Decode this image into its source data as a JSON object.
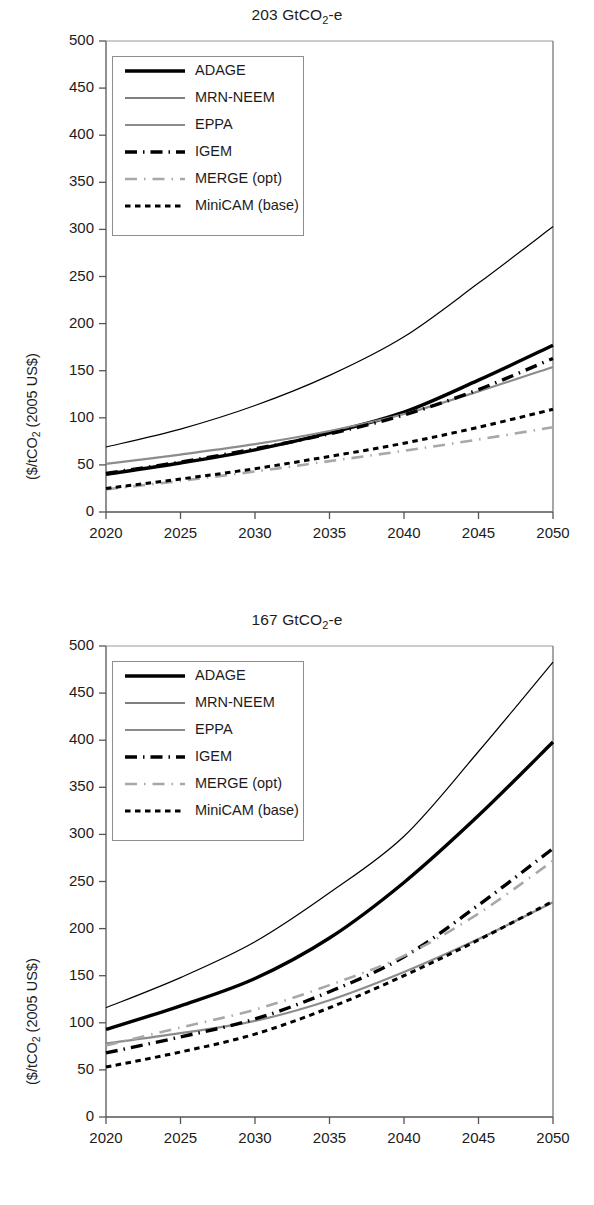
{
  "figure": {
    "ylabel": "($/tCO2 (2005 US$)",
    "ylabel_main": "($/tCO",
    "ylabel_sub": "2",
    "ylabel_tail": " (2005 US$)"
  },
  "legend": {
    "items": [
      {
        "label": "ADAGE",
        "style": "thick-solid",
        "color": "#000000"
      },
      {
        "label": "MRN-NEEM",
        "style": "thin-solid",
        "color": "#000000"
      },
      {
        "label": "EPPA",
        "style": "gray-solid",
        "color": "#8c8c8c"
      },
      {
        "label": "IGEM",
        "style": "dash-dot",
        "color": "#000000"
      },
      {
        "label": "MERGE (opt)",
        "style": "gray-dash-dot",
        "color": "#a8a8a8"
      },
      {
        "label": "MiniCAM (base)",
        "style": "dotted",
        "color": "#000000"
      }
    ]
  },
  "chart_data": [
    {
      "type": "line",
      "title": "203 GtCO2-e",
      "title_main": "203 GtCO",
      "title_sub": "2",
      "title_tail": "-e",
      "xlabel": "",
      "ylabel": "($/tCO2 (2005 US$)",
      "x": [
        2020,
        2025,
        2030,
        2035,
        2040,
        2045,
        2050
      ],
      "xlim": [
        2020,
        2050
      ],
      "ylim": [
        0,
        500
      ],
      "yticks": [
        0,
        50,
        100,
        150,
        200,
        250,
        300,
        350,
        400,
        450,
        500
      ],
      "xticks": [
        2020,
        2025,
        2030,
        2035,
        2040,
        2045,
        2050
      ],
      "grid": false,
      "legend_position": "upper-left",
      "series": [
        {
          "name": "ADAGE",
          "values": [
            40,
            52,
            66,
            84,
            106,
            140,
            177
          ]
        },
        {
          "name": "MRN-NEEM",
          "values": [
            69,
            88,
            113,
            145,
            186,
            243,
            303
          ]
        },
        {
          "name": "EPPA",
          "values": [
            51,
            61,
            72,
            86,
            104,
            128,
            154
          ]
        },
        {
          "name": "IGEM",
          "values": [
            41,
            53,
            67,
            83,
            103,
            130,
            163
          ]
        },
        {
          "name": "MERGE (opt)",
          "values": [
            24,
            33,
            43,
            54,
            65,
            77,
            90
          ]
        },
        {
          "name": "MiniCAM (base)",
          "values": [
            25,
            35,
            46,
            59,
            73,
            90,
            109
          ]
        }
      ]
    },
    {
      "type": "line",
      "title": "167 GtCO2-e",
      "title_main": "167 GtCO",
      "title_sub": "2",
      "title_tail": "-e",
      "xlabel": "",
      "ylabel": "($/tCO2 (2005 US$)",
      "x": [
        2020,
        2025,
        2030,
        2035,
        2040,
        2045,
        2050
      ],
      "xlim": [
        2020,
        2050
      ],
      "ylim": [
        0,
        500
      ],
      "yticks": [
        0,
        50,
        100,
        150,
        200,
        250,
        300,
        350,
        400,
        450,
        500
      ],
      "xticks": [
        2020,
        2025,
        2030,
        2035,
        2040,
        2045,
        2050
      ],
      "grid": false,
      "legend_position": "upper-left",
      "series": [
        {
          "name": "ADAGE",
          "values": [
            93,
            118,
            147,
            190,
            249,
            320,
            398
          ]
        },
        {
          "name": "MRN-NEEM",
          "values": [
            116,
            148,
            186,
            238,
            298,
            388,
            483
          ]
        },
        {
          "name": "EPPA",
          "values": [
            78,
            89,
            102,
            124,
            154,
            189,
            228
          ]
        },
        {
          "name": "IGEM",
          "values": [
            68,
            85,
            104,
            133,
            170,
            225,
            285
          ]
        },
        {
          "name": "MERGE (opt)",
          "values": [
            76,
            95,
            114,
            140,
            171,
            216,
            272
          ]
        },
        {
          "name": "MiniCAM (base)",
          "values": [
            53,
            69,
            88,
            116,
            150,
            188,
            229
          ]
        }
      ]
    }
  ]
}
